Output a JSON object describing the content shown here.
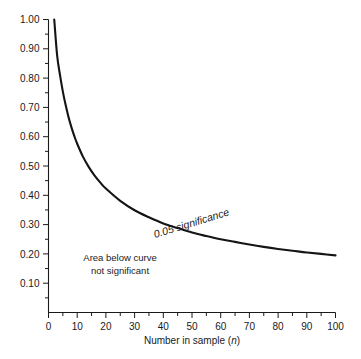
{
  "chart_data": {
    "type": "line",
    "title": "",
    "subtitle": "",
    "xlabel": "Number in sample (n)",
    "xlabel_plain": "Number in sample (",
    "xlabel_italic": "n",
    "xlabel_close": ")",
    "ylabel": "",
    "xlim": [
      0,
      100
    ],
    "ylim": [
      0,
      1.0
    ],
    "grid": false,
    "legend": "none",
    "x_ticks_major": [
      0,
      10,
      20,
      30,
      40,
      50,
      60,
      70,
      80,
      90,
      100
    ],
    "x_tick_labels": [
      "0",
      "10",
      "20",
      "30",
      "40",
      "50",
      "60",
      "70",
      "80",
      "90",
      "100"
    ],
    "x_ticks_minor": [
      5,
      15,
      25,
      35,
      45,
      55,
      65,
      75,
      85,
      95
    ],
    "y_ticks_major": [
      0.1,
      0.2,
      0.3,
      0.4,
      0.5,
      0.6,
      0.7,
      0.8,
      0.9,
      1.0
    ],
    "y_tick_labels": [
      "0.10",
      "0.20",
      "0.30",
      "0.40",
      "0.50",
      "0.60",
      "0.70",
      "0.80",
      "0.90",
      "1.00"
    ],
    "y_ticks_minor": [
      0.05,
      0.15,
      0.25,
      0.35,
      0.45,
      0.55,
      0.65,
      0.75,
      0.85,
      0.95
    ],
    "series": [
      {
        "name": "0.05 significance",
        "x": [
          2,
          3,
          4,
          5,
          6,
          7,
          8,
          9,
          10,
          12,
          14,
          16,
          18,
          20,
          25,
          30,
          35,
          40,
          45,
          50,
          55,
          60,
          65,
          70,
          75,
          80,
          85,
          90,
          95,
          100
        ],
        "values": [
          1.0,
          0.878,
          0.811,
          0.754,
          0.707,
          0.666,
          0.632,
          0.602,
          0.576,
          0.532,
          0.497,
          0.468,
          0.444,
          0.423,
          0.381,
          0.349,
          0.325,
          0.304,
          0.288,
          0.273,
          0.261,
          0.25,
          0.241,
          0.232,
          0.224,
          0.217,
          0.211,
          0.205,
          0.2,
          0.195
        ]
      }
    ],
    "annotations": [
      {
        "id": "curve-label",
        "text": "0.05 significance",
        "style": "italic",
        "rotated": true,
        "rotation_deg": 17
      },
      {
        "id": "region-note",
        "line1": "Area below curve",
        "line2": "not significant"
      }
    ],
    "colors": {
      "background": "#ffffff",
      "curve": "#151515",
      "axis": "#1a1a1a",
      "text": "#1a1a1a"
    }
  }
}
